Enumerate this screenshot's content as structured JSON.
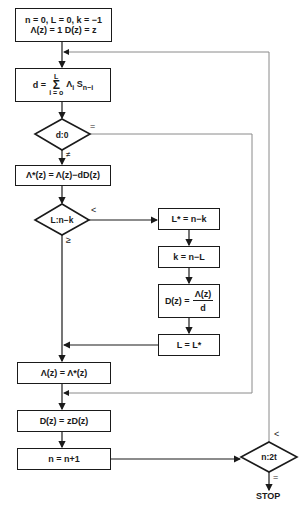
{
  "flowchart": {
    "init": {
      "line1": "n = 0,  L = 0,  k = −1",
      "line2": "Λ(z) = 1   D(z) = z"
    },
    "discrepancy": {
      "lhs": "d =",
      "sum_upper": "L",
      "sum_symbol": "Σ",
      "sum_lower": "i = o",
      "term": "Λ",
      "term_sub": "i",
      "seq": "S",
      "seq_sub": "n−i"
    },
    "decision_d": {
      "text": "d:0",
      "equal_label": "=",
      "notequal_label": "≠"
    },
    "update_lambda_star": "Λ*(z) =  Λ(z)−dD(z)",
    "decision_L": {
      "text": "L:n−k",
      "less_label": "<",
      "geq_label": "≥"
    },
    "branch": {
      "lstar": "L* = n−k",
      "k_update": "k = n−L",
      "dz_lhs": "D(z) =",
      "dz_num": "Λ(z)",
      "dz_den": "d",
      "l_update": "L  =  L*"
    },
    "assign_lambda": "Λ(z)  =  Λ*(z)",
    "shift_d": "D(z)  =  zD(z)",
    "increment_n": "n  =  n+1",
    "decision_n": {
      "text": "n:2t",
      "less_label": "<",
      "equal_label": "="
    },
    "stop_label": "STOP"
  },
  "colors": {
    "line": "#1a1a1a",
    "feedback_line": "#8a8a8a",
    "background": "#ffffff"
  }
}
